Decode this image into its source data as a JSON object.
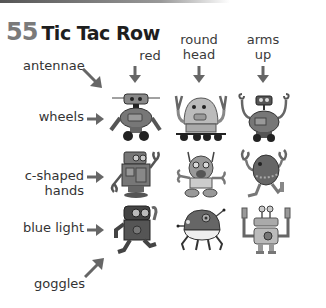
{
  "page": {
    "number": "55",
    "title": "Tic Tac Row"
  },
  "columns": [
    {
      "label_line1": "",
      "label_line2": "red"
    },
    {
      "label_line1": "round",
      "label_line2": "head"
    },
    {
      "label_line1": "arms",
      "label_line2": "up"
    }
  ],
  "rows": [
    {
      "label_line1": "",
      "label_line2": "wheels"
    },
    {
      "label_line1": "c-shaped",
      "label_line2": "hands"
    },
    {
      "label_line1": "",
      "label_line2": "blue light"
    }
  ],
  "diagonals": {
    "top": "antennae",
    "bottom": "goggles"
  },
  "robots": [
    [
      "robot-box-head-wheels",
      "robot-dome-wheels-arms-up",
      "robot-antenna-arms-up-wheels"
    ],
    [
      "robot-boxy-c-hands",
      "robot-round-c-hands",
      "robot-egg-c-hands-arms-up"
    ],
    [
      "robot-goggles-walking",
      "robot-round-spider",
      "robot-eyestalks-arms-up"
    ]
  ]
}
